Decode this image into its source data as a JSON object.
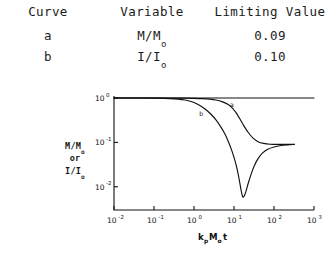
{
  "table": {
    "headers": [
      "Curve",
      "Variable",
      "Limiting Value"
    ],
    "rows": [
      {
        "curve": "a",
        "variable_num": "M/M",
        "variable_sub": "o",
        "limiting_value": "0.09"
      },
      {
        "curve": "b",
        "variable_num": "I/I",
        "variable_sub": "o",
        "limiting_value": "0.10"
      }
    ]
  },
  "axis_label": {
    "line1_num": "M/M",
    "line1_sub": "o",
    "line2": "or",
    "line3_num": "I/I",
    "line3_sub": "o"
  },
  "xaxis_title": {
    "k": "k",
    "k_sub": "p",
    "M": "M",
    "M_sub": "o",
    "t": "t"
  },
  "chart_data": {
    "type": "line",
    "title": "",
    "xlabel": "k_p M_o t",
    "ylabel": "M/M_o or I/I_o",
    "xscale": "log",
    "yscale": "log",
    "xlim": [
      0.01,
      1000
    ],
    "ylim": [
      0.003,
      1.0
    ],
    "xticks": [
      0.01,
      0.1,
      1,
      10,
      100,
      1000
    ],
    "xtick_labels": [
      "10-2",
      "10-1",
      "10 0",
      "10 1",
      "10 2",
      "10 3"
    ],
    "xtick_mantissa": [
      "10",
      "10",
      "10",
      "10",
      "10",
      "10"
    ],
    "xtick_exponents": [
      "-2",
      "-1",
      "0",
      "1",
      "2",
      "3"
    ],
    "yticks": [
      1,
      0.1,
      0.01
    ],
    "ytick_mantissa": [
      "10",
      "10",
      "10"
    ],
    "ytick_exponents": [
      "0",
      "-1",
      "-2"
    ],
    "grid": false,
    "legend": "inline-annotations",
    "series": [
      {
        "name": "reference",
        "label": "",
        "comment": "horizontal reference line at y = 1",
        "points": [
          [
            0.01,
            1.0
          ],
          [
            1000,
            1.0
          ]
        ]
      },
      {
        "name": "a",
        "label": "a",
        "label_at": [
          8.0,
          0.62
        ],
        "limiting_value": 0.09,
        "points": [
          [
            0.01,
            1.0
          ],
          [
            0.1,
            0.999
          ],
          [
            0.3,
            0.996
          ],
          [
            0.6,
            0.99
          ],
          [
            1.0,
            0.982
          ],
          [
            1.6,
            0.968
          ],
          [
            2.5,
            0.94
          ],
          [
            3.5,
            0.9
          ],
          [
            5.0,
            0.83
          ],
          [
            7.0,
            0.72
          ],
          [
            9.0,
            0.6
          ],
          [
            11.0,
            0.48
          ],
          [
            14.0,
            0.34
          ],
          [
            18.0,
            0.23
          ],
          [
            23.0,
            0.165
          ],
          [
            30.0,
            0.125
          ],
          [
            40.0,
            0.104
          ],
          [
            55.0,
            0.095
          ],
          [
            80.0,
            0.091
          ],
          [
            130.0,
            0.09
          ],
          [
            220.0,
            0.09
          ],
          [
            320.0,
            0.09
          ]
        ]
      },
      {
        "name": "b",
        "label": "b",
        "label_at": [
          1.35,
          0.4
        ],
        "limiting_value": 0.1,
        "minimum": [
          16.0,
          0.006
        ],
        "points": [
          [
            0.01,
            1.0
          ],
          [
            0.05,
            0.998
          ],
          [
            0.12,
            0.99
          ],
          [
            0.25,
            0.97
          ],
          [
            0.4,
            0.945
          ],
          [
            0.6,
            0.9
          ],
          [
            0.85,
            0.835
          ],
          [
            1.1,
            0.76
          ],
          [
            1.5,
            0.655
          ],
          [
            2.0,
            0.545
          ],
          [
            2.7,
            0.425
          ],
          [
            3.5,
            0.325
          ],
          [
            4.5,
            0.235
          ],
          [
            5.8,
            0.16
          ],
          [
            7.2,
            0.105
          ],
          [
            9.0,
            0.062
          ],
          [
            11.0,
            0.034
          ],
          [
            13.0,
            0.0175
          ],
          [
            15.0,
            0.0085
          ],
          [
            16.5,
            0.006
          ],
          [
            18.0,
            0.0062
          ],
          [
            20.0,
            0.008
          ],
          [
            23.0,
            0.0125
          ],
          [
            27.0,
            0.0195
          ],
          [
            32.0,
            0.0295
          ],
          [
            40.0,
            0.043
          ],
          [
            52.0,
            0.058
          ],
          [
            70.0,
            0.07
          ],
          [
            100.0,
            0.079
          ],
          [
            150.0,
            0.085
          ],
          [
            220.0,
            0.088
          ],
          [
            320.0,
            0.09
          ]
        ]
      }
    ]
  }
}
